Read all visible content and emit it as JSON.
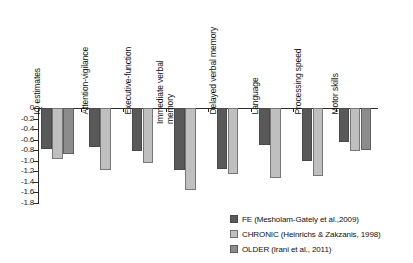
{
  "chart_data": {
    "type": "bar",
    "title": "",
    "subtitle": "",
    "xlabel": "",
    "ylabel": "",
    "orientation": "vertical",
    "grid": false,
    "legend_position": "bottom-right",
    "ylim": [
      -1.8,
      0
    ],
    "yticks": [
      "0",
      "-0.2",
      "-0.4",
      "-0.6",
      "-0.8",
      "-1.0",
      "-1.2",
      "-1.4",
      "-1.6",
      "-1.8"
    ],
    "ytick_values": [
      0,
      -0.2,
      -0.4,
      -0.6,
      -0.8,
      -1.0,
      -1.2,
      -1.4,
      -1.6,
      -1.8
    ],
    "categories": [
      "IQ estimates",
      "Attention-vigilance",
      "Executive-function",
      "Immediate verbal\nmemory",
      "Delayed verbal memory",
      "Language",
      "Processing speed",
      "Motor skills"
    ],
    "series": [
      {
        "name": "FE (Mesholam-Gately et al.,2009)",
        "short": "FE",
        "color": "#595959",
        "values": [
          -0.78,
          -0.73,
          -0.82,
          -1.18,
          -1.15,
          -0.7,
          -1.0,
          -0.65
        ]
      },
      {
        "name": "CHRONIC (Heinrichs & Zakzanis, 1998)",
        "short": "CHRONIC",
        "color": "#bfbfbf",
        "values": [
          -0.96,
          -1.17,
          -1.05,
          -1.56,
          -1.25,
          -1.33,
          -1.28,
          -0.82
        ]
      },
      {
        "name": "OLDER (Irani et al., 2011)",
        "short": "OLDER",
        "color": "#8c8c8c",
        "values": [
          -0.87,
          null,
          null,
          null,
          null,
          null,
          null,
          -0.8
        ]
      }
    ]
  },
  "legend": {
    "items": [
      {
        "label": "FE (Mesholam-Gately et al.,2009)",
        "color": "#595959"
      },
      {
        "label": "CHRONIC (Heinrichs & Zakzanis, 1998)",
        "color": "#bfbfbf"
      },
      {
        "label": "OLDER (Irani et al., 2011)",
        "color": "#8c8c8c"
      }
    ]
  }
}
